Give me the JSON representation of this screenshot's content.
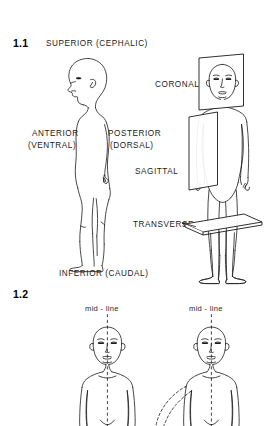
{
  "page": {
    "background_color": "#ffffff",
    "line_color": "#1a1a1a",
    "text_color": "#1a1a1a"
  },
  "figures": [
    {
      "number": "1.1",
      "caption_labels": {
        "superior": "SUPERIOR  (CEPHALIC)",
        "anterior_line1": "ANTERIOR",
        "anterior_line2": "(VENTRAL)",
        "posterior_line1": "POSTERIOR",
        "posterior_line2": "(DORSAL)",
        "inferior": "INFERIOR  (CAUDAL)",
        "coronal": "CORONAL",
        "sagittal": "SAGITTAL",
        "transverse": "TRANSVERSE"
      },
      "subject": "lateral-profile-body and anterior-body-with-anatomical-planes"
    },
    {
      "number": "1.2",
      "midline_label_left": "mid - line",
      "midline_label_right": "mid - line",
      "subject": "two anterior body figures showing mid-line and limb abduction"
    }
  ]
}
